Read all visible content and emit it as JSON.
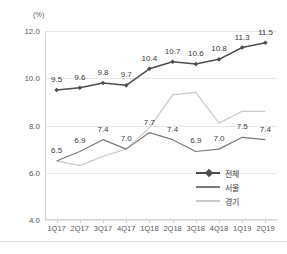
{
  "unit_label": "(%)",
  "chart_data": {
    "type": "line",
    "title": "",
    "xlabel": "",
    "ylabel": "(%)",
    "ylim": [
      4.0,
      12.0
    ],
    "yticks": [
      "4.0",
      "6.0",
      "8.0",
      "10.0",
      "12.0"
    ],
    "grid": true,
    "legend_position": "inside-bottom-right",
    "categories": [
      "1Q17",
      "2Q17",
      "3Q17",
      "4Q17",
      "1Q18",
      "2Q18",
      "3Q18",
      "4Q18",
      "1Q19",
      "2Q19"
    ],
    "series": [
      {
        "name": "전체",
        "color": "#4d4d4d",
        "marker": "diamond",
        "labeled": true,
        "values": [
          9.5,
          9.6,
          9.8,
          9.7,
          10.4,
          10.7,
          10.6,
          10.8,
          11.3,
          11.5
        ],
        "labels": [
          "9.5",
          "9.6",
          "9.8",
          "9.7",
          "10.4",
          "10.7",
          "10.6",
          "10.8",
          "11.3",
          "11.5"
        ]
      },
      {
        "name": "서울",
        "color": "#7a7a7a",
        "marker": "none",
        "labeled": true,
        "values": [
          6.5,
          6.9,
          7.4,
          7.0,
          7.7,
          7.4,
          6.9,
          7.0,
          7.5,
          7.4
        ],
        "labels": [
          "6.5",
          "6.9",
          "7.4",
          "7.0",
          "7.7",
          "7.4",
          "6.9",
          "7.0",
          "7.5",
          "7.4"
        ]
      },
      {
        "name": "경기",
        "color": "#c9c9c9",
        "marker": "none",
        "labeled": false,
        "values": [
          6.5,
          6.3,
          6.7,
          7.0,
          7.9,
          9.3,
          9.4,
          8.1,
          8.6,
          8.6
        ],
        "labels": []
      }
    ]
  },
  "legend": {
    "items": [
      {
        "label": "전체"
      },
      {
        "label": "서울"
      },
      {
        "label": "경기"
      }
    ]
  },
  "colors": {
    "total_line": "#4d4d4d",
    "seoul_line": "#7a7a7a",
    "gyeonggi_line": "#c9c9c9",
    "grid": "#e6e6e6",
    "axis": "#d2d2d2",
    "text": "#58585a"
  }
}
